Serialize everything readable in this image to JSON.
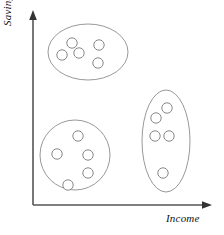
{
  "figure": {
    "title": "",
    "background_color": "#ffffff",
    "axis_color": "#555555",
    "cluster_stroke_color": "#8c8c8c",
    "point_stroke_color": "#7a7a7a",
    "point_fill_color": "#ffffff"
  },
  "axes": {
    "y": {
      "label": "Savings",
      "arrow": "arrow-up",
      "x": 33,
      "y_top": 14,
      "y_bottom": 205
    },
    "x": {
      "label": "Income",
      "arrow": "arrow-right",
      "y": 205,
      "x_left": 33,
      "x_right": 209
    }
  },
  "chart_data": {
    "type": "scatter",
    "title": "",
    "xlabel": "Income",
    "ylabel": "Savings",
    "grid": false,
    "legend": "none",
    "axis_style": "arrow-axes-no-ticks",
    "xlim": [
      0,
      100
    ],
    "ylim": [
      0,
      100
    ],
    "annotation": "Three clusters of data points, each enclosed by a hand-drawn outline",
    "clusters": [
      {
        "name": "cluster-top-left",
        "shape": "ellipse",
        "outline": {
          "cx": 88,
          "cy": 52,
          "rx": 40,
          "ry": 28,
          "rotation": 0
        },
        "point_count": 5,
        "points": [
          {
            "cx": 72,
            "cy": 43,
            "r": 5.2
          },
          {
            "cx": 99,
            "cy": 45,
            "r": 5.2
          },
          {
            "cx": 79,
            "cy": 53,
            "r": 5.2
          },
          {
            "cx": 62,
            "cy": 55,
            "r": 5.2
          },
          {
            "cx": 98,
            "cy": 63,
            "r": 5.2
          }
        ]
      },
      {
        "name": "cluster-bottom-left",
        "shape": "circle",
        "outline": {
          "cx": 75,
          "cy": 155,
          "rx": 35,
          "ry": 35,
          "rotation": 0
        },
        "point_count": 5,
        "points": [
          {
            "cx": 78,
            "cy": 136,
            "r": 5.2
          },
          {
            "cx": 57,
            "cy": 154,
            "r": 5.2
          },
          {
            "cx": 88,
            "cy": 155,
            "r": 5.2
          },
          {
            "cx": 88,
            "cy": 173,
            "r": 5.2
          },
          {
            "cx": 68,
            "cy": 185,
            "r": 5.2
          }
        ]
      },
      {
        "name": "cluster-right",
        "shape": "ellipse",
        "outline": {
          "cx": 166,
          "cy": 141,
          "rx": 24,
          "ry": 51,
          "rotation": 0
        },
        "point_count": 5,
        "points": [
          {
            "cx": 167,
            "cy": 108,
            "r": 5.2
          },
          {
            "cx": 156,
            "cy": 118,
            "r": 5.2
          },
          {
            "cx": 155,
            "cy": 136,
            "r": 5.2
          },
          {
            "cx": 169,
            "cy": 136,
            "r": 5.2
          },
          {
            "cx": 163,
            "cy": 173,
            "r": 5.2
          }
        ]
      }
    ]
  }
}
